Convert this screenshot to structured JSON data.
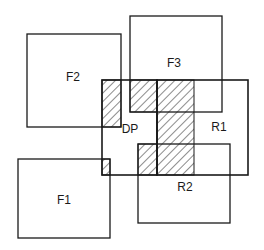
{
  "diagram": {
    "type": "overlapping-regions",
    "stroke_color": "#1a1a1a",
    "hatch_color": "#1a1a1a",
    "background": "#ffffff",
    "regions": [
      {
        "id": "F2",
        "label": "F2",
        "x": 27,
        "y": 34,
        "w": 94,
        "h": 93,
        "label_x": 73,
        "label_y": 77
      },
      {
        "id": "F3",
        "label": "F3",
        "x": 130,
        "y": 16,
        "w": 92,
        "h": 96,
        "label_x": 174,
        "label_y": 63
      },
      {
        "id": "F1",
        "label": "F1",
        "x": 18,
        "y": 159,
        "w": 92,
        "h": 79,
        "label_x": 64,
        "label_y": 200
      },
      {
        "id": "DP",
        "label": "DP",
        "x": 102,
        "y": 80,
        "w": 55,
        "h": 95,
        "label_x": 130,
        "label_y": 129
      },
      {
        "id": "R1",
        "label": "R1",
        "x": 157,
        "y": 80,
        "w": 91,
        "h": 95,
        "label_x": 219,
        "label_y": 127
      },
      {
        "id": "R2",
        "label": "R2",
        "x": 138,
        "y": 144,
        "w": 92,
        "h": 79,
        "label_x": 185,
        "label_y": 187
      }
    ],
    "hatched_overlaps": [
      {
        "id": "F2-DP",
        "x": 102,
        "y": 80,
        "w": 19,
        "h": 47
      },
      {
        "id": "F3-DP",
        "x": 130,
        "y": 80,
        "w": 27,
        "h": 32
      },
      {
        "id": "DP-R1-column",
        "x": 157,
        "y": 80,
        "w": 37,
        "h": 95
      },
      {
        "id": "R2-DP",
        "x": 138,
        "y": 144,
        "w": 19,
        "h": 31
      },
      {
        "id": "F1-DP-corner",
        "x": 102,
        "y": 159,
        "w": 8,
        "h": 16
      }
    ]
  }
}
